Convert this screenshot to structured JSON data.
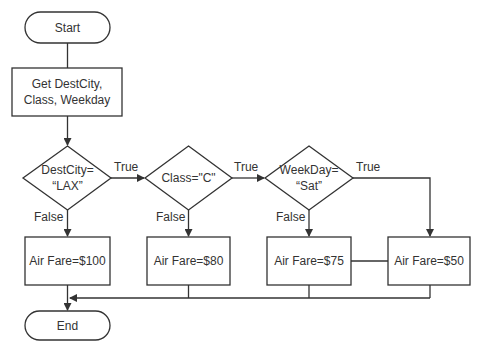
{
  "diagram": {
    "type": "flowchart",
    "colors": {
      "stroke": "#333333",
      "background": "#ffffff",
      "text": "#333333"
    },
    "nodes": {
      "start": {
        "shape": "terminator",
        "label": "Start"
      },
      "input": {
        "shape": "process",
        "label_line1": "Get DestCity,",
        "label_line2": "Class, Weekday"
      },
      "decision_city": {
        "shape": "decision",
        "label_line1": "DestCity=",
        "label_line2": "“LAX”"
      },
      "decision_class": {
        "shape": "decision",
        "label": "Class=\"C\""
      },
      "decision_day": {
        "shape": "decision",
        "label_line1": "WeekDay=",
        "label_line2": "“Sat”"
      },
      "fare_100": {
        "shape": "process",
        "label": "Air Fare=$100"
      },
      "fare_80": {
        "shape": "process",
        "label": "Air Fare=$80"
      },
      "fare_75": {
        "shape": "process",
        "label": "Air Fare=$75"
      },
      "fare_50": {
        "shape": "process",
        "label": "Air Fare=$50"
      },
      "end": {
        "shape": "terminator",
        "label": "End"
      }
    },
    "edge_labels": {
      "city_true": "True",
      "city_false": "False",
      "class_true": "True",
      "class_false": "False",
      "day_true": "True",
      "day_false": "False"
    },
    "edges": [
      {
        "from": "start",
        "to": "input"
      },
      {
        "from": "input",
        "to": "decision_city"
      },
      {
        "from": "decision_city",
        "to": "decision_class",
        "label": "True"
      },
      {
        "from": "decision_city",
        "to": "fare_100",
        "label": "False"
      },
      {
        "from": "decision_class",
        "to": "decision_day",
        "label": "True"
      },
      {
        "from": "decision_class",
        "to": "fare_80",
        "label": "False"
      },
      {
        "from": "decision_day",
        "to": "fare_50",
        "label": "True"
      },
      {
        "from": "decision_day",
        "to": "fare_75",
        "label": "False"
      },
      {
        "from": "fare_100",
        "to": "end"
      },
      {
        "from": "fare_80",
        "to": "end"
      },
      {
        "from": "fare_75",
        "to": "end"
      },
      {
        "from": "fare_50",
        "to": "end"
      }
    ]
  }
}
